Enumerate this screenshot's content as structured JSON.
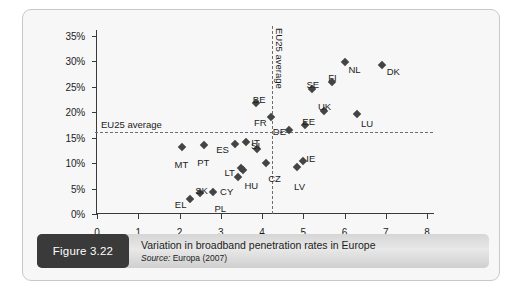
{
  "figure": {
    "badge_label": "Figure 3.22",
    "caption_title": "Variation in broadband penetration rates in Europe",
    "source_word": "Source:",
    "source_text": " Europa (2007)"
  },
  "chart_data": {
    "type": "scatter",
    "title": "Variation in broadband penetration rates in Europe",
    "xlabel": "",
    "ylabel": "",
    "xlim": [
      0,
      8
    ],
    "ylim": [
      0,
      35
    ],
    "grid": false,
    "legend": "none",
    "x_ticks": [
      0,
      1,
      2,
      3,
      4,
      5,
      6,
      7,
      8
    ],
    "x_tick_labels": [
      "0",
      "1",
      "2",
      "3",
      "4",
      "5",
      "6",
      "7",
      "8"
    ],
    "y_ticks": [
      0,
      5,
      10,
      15,
      20,
      25,
      30,
      35
    ],
    "y_tick_labels": [
      "0%",
      "5%",
      "10%",
      "15%",
      "20%",
      "25%",
      "30%",
      "35%"
    ],
    "reference_lines": [
      {
        "id": "eu25-avg-horizontal",
        "orientation": "horizontal",
        "value": 16.1,
        "label": "EU25 average",
        "style": "dashed"
      },
      {
        "id": "eu25-avg-vertical",
        "orientation": "vertical",
        "value": 4.25,
        "label": "EU25 average",
        "style": "dashed"
      }
    ],
    "marker_color": "#444444",
    "points": [
      {
        "label": "EL",
        "x": 2.25,
        "y": 3.0,
        "lx": -15,
        "ly": 1
      },
      {
        "label": "MT",
        "x": 2.05,
        "y": 13.2,
        "lx": -7,
        "ly": 13
      },
      {
        "label": "SK",
        "x": 2.5,
        "y": 4.2,
        "lx": -5,
        "ly": -7
      },
      {
        "label": "PT",
        "x": 2.6,
        "y": 13.5,
        "lx": -7,
        "ly": 13
      },
      {
        "label": "PL",
        "x": 2.8,
        "y": 4.4,
        "lx": 2,
        "ly": 12
      },
      {
        "label": "ES",
        "x": 3.35,
        "y": 13.8,
        "lx": -19,
        "ly": 1
      },
      {
        "label": "CY",
        "x": 3.42,
        "y": 7.3,
        "lx": -18,
        "ly": 10
      },
      {
        "label": "LT",
        "x": 3.5,
        "y": 9.1,
        "lx": -17,
        "ly": 0
      },
      {
        "label": "HU",
        "x": 3.55,
        "y": 8.7,
        "lx": 1,
        "ly": 11
      },
      {
        "label": "IT",
        "x": 3.62,
        "y": 14.1,
        "lx": 5,
        "ly": -4
      },
      {
        "label": "BE",
        "x": 3.85,
        "y": 21.9,
        "lx": -3,
        "ly": -8
      },
      {
        "label": "SI",
        "x": 3.88,
        "y": 12.7,
        "lx": -6,
        "ly": -8
      },
      {
        "label": "CZ",
        "x": 4.1,
        "y": 10.0,
        "lx": 2,
        "ly": 11
      },
      {
        "label": "FR",
        "x": 4.22,
        "y": 19.0,
        "lx": -17,
        "ly": 1
      },
      {
        "label": "DE",
        "x": 4.65,
        "y": 16.5,
        "lx": -16,
        "ly": -3
      },
      {
        "label": "LV",
        "x": 4.85,
        "y": 9.3,
        "lx": -3,
        "ly": 15
      },
      {
        "label": "IE",
        "x": 5.0,
        "y": 10.5,
        "lx": 3,
        "ly": -7
      },
      {
        "label": "EE",
        "x": 5.05,
        "y": 17.5,
        "lx": -3,
        "ly": -8
      },
      {
        "label": "SE",
        "x": 5.2,
        "y": 24.5,
        "lx": -5,
        "ly": -9
      },
      {
        "label": "UK",
        "x": 5.5,
        "y": 20.2,
        "lx": -6,
        "ly": -9
      },
      {
        "label": "FI",
        "x": 5.7,
        "y": 26.0,
        "lx": -4,
        "ly": -9
      },
      {
        "label": "NL",
        "x": 6.0,
        "y": 29.8,
        "lx": 4,
        "ly": 3
      },
      {
        "label": "LU",
        "x": 6.3,
        "y": 19.7,
        "lx": 4,
        "ly": 5
      },
      {
        "label": "DK",
        "x": 6.9,
        "y": 29.3,
        "lx": 5,
        "ly": 2
      }
    ]
  }
}
